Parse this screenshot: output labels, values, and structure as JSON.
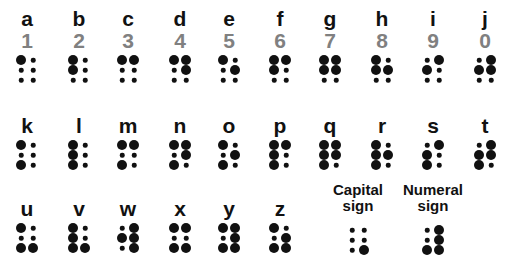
{
  "rows": [
    {
      "cells": [
        {
          "letter": "a",
          "digit": "1",
          "dots": [
            1,
            0,
            0,
            0,
            0,
            0
          ]
        },
        {
          "letter": "b",
          "digit": "2",
          "dots": [
            1,
            1,
            0,
            0,
            0,
            0
          ]
        },
        {
          "letter": "c",
          "digit": "3",
          "dots": [
            1,
            0,
            0,
            1,
            0,
            0
          ]
        },
        {
          "letter": "d",
          "digit": "4",
          "dots": [
            1,
            0,
            0,
            1,
            1,
            0
          ]
        },
        {
          "letter": "e",
          "digit": "5",
          "dots": [
            1,
            0,
            0,
            0,
            1,
            0
          ]
        },
        {
          "letter": "f",
          "digit": "6",
          "dots": [
            1,
            1,
            0,
            1,
            0,
            0
          ]
        },
        {
          "letter": "g",
          "digit": "7",
          "dots": [
            1,
            1,
            0,
            1,
            1,
            0
          ]
        },
        {
          "letter": "h",
          "digit": "8",
          "dots": [
            1,
            1,
            0,
            0,
            1,
            0
          ]
        },
        {
          "letter": "i",
          "digit": "9",
          "dots": [
            0,
            1,
            0,
            1,
            0,
            0
          ]
        },
        {
          "letter": "j",
          "digit": "0",
          "dots": [
            0,
            1,
            0,
            1,
            1,
            0
          ]
        }
      ]
    },
    {
      "cells": [
        {
          "letter": "k",
          "dots": [
            1,
            0,
            1,
            0,
            0,
            0
          ]
        },
        {
          "letter": "l",
          "dots": [
            1,
            1,
            1,
            0,
            0,
            0
          ]
        },
        {
          "letter": "m",
          "dots": [
            1,
            0,
            1,
            1,
            0,
            0
          ]
        },
        {
          "letter": "n",
          "dots": [
            1,
            0,
            1,
            1,
            1,
            0
          ]
        },
        {
          "letter": "o",
          "dots": [
            1,
            0,
            1,
            0,
            1,
            0
          ]
        },
        {
          "letter": "p",
          "dots": [
            1,
            1,
            1,
            1,
            0,
            0
          ]
        },
        {
          "letter": "q",
          "dots": [
            1,
            1,
            1,
            1,
            1,
            0
          ]
        },
        {
          "letter": "r",
          "dots": [
            1,
            1,
            1,
            0,
            1,
            0
          ]
        },
        {
          "letter": "s",
          "dots": [
            0,
            1,
            1,
            1,
            0,
            0
          ]
        },
        {
          "letter": "t",
          "dots": [
            0,
            1,
            1,
            1,
            1,
            0
          ]
        }
      ]
    },
    {
      "cells": [
        {
          "letter": "u",
          "dots": [
            1,
            0,
            1,
            0,
            0,
            1
          ]
        },
        {
          "letter": "v",
          "dots": [
            1,
            1,
            1,
            0,
            0,
            1
          ]
        },
        {
          "letter": "w",
          "dots": [
            0,
            1,
            0,
            1,
            1,
            1
          ]
        },
        {
          "letter": "x",
          "dots": [
            1,
            0,
            1,
            1,
            0,
            1
          ]
        },
        {
          "letter": "y",
          "dots": [
            1,
            0,
            1,
            1,
            1,
            1
          ]
        },
        {
          "letter": "z",
          "dots": [
            1,
            0,
            1,
            0,
            1,
            1
          ]
        }
      ],
      "signs": [
        {
          "label_line1": "Capital",
          "label_line2": "sign",
          "dots": [
            0,
            0,
            0,
            0,
            0,
            1
          ]
        },
        {
          "label_line1": "Numeral",
          "label_line2": "sign",
          "dots": [
            0,
            0,
            1,
            1,
            1,
            1
          ]
        }
      ]
    }
  ]
}
